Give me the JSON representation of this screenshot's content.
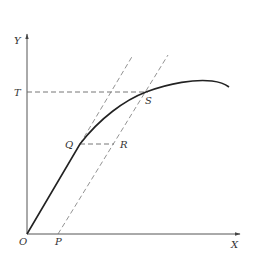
{
  "diagram": {
    "type": "stress-strain offset diagram",
    "colors": {
      "curve": "#222222",
      "axis": "#555555",
      "dashed": "#666666",
      "text": "#333333"
    },
    "axes": {
      "x_label": "X",
      "y_label": "Y",
      "origin_label": "O"
    },
    "points": {
      "O": {
        "label": "O",
        "x": 27,
        "y": 234
      },
      "P": {
        "label": "P",
        "x": 58,
        "y": 234
      },
      "Q": {
        "label": "Q",
        "x": 80,
        "y": 144
      },
      "R": {
        "label": "R",
        "x": 114,
        "y": 144
      },
      "S": {
        "label": "S",
        "x": 146,
        "y": 92
      },
      "T": {
        "label": "T",
        "x": 27,
        "y": 92
      }
    },
    "labels": {
      "Y": "Y",
      "X": "X",
      "O": "O",
      "P": "P",
      "Q": "Q",
      "R": "R",
      "S": "S",
      "T": "T"
    }
  }
}
